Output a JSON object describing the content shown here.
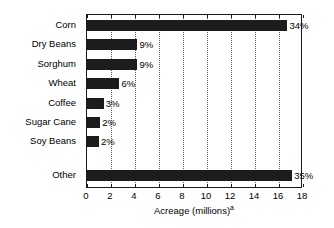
{
  "chart_data": {
    "type": "bar",
    "orientation": "horizontal",
    "title": "",
    "xlabel": "Acreage (millions)",
    "xlabel_superscript": "a",
    "ylabel": "",
    "xlim": [
      0,
      18
    ],
    "xticks": [
      0,
      2,
      4,
      6,
      8,
      10,
      12,
      14,
      16,
      18
    ],
    "xtick_labels": [
      "0",
      "2",
      "4",
      "6",
      "8",
      "10",
      "12",
      "14",
      "16",
      "18"
    ],
    "grid": "vertical-dotted",
    "legend": "none",
    "bar_color": "#1c1c1c",
    "categories": [
      "Corn",
      "Dry Beans",
      "Sorghum",
      "Wheat",
      "Coffee",
      "Sugar Cane",
      "Soy Beans",
      "Other"
    ],
    "values": [
      16.7,
      4.2,
      4.2,
      2.7,
      1.4,
      1.1,
      1.0,
      17.1
    ],
    "data_labels": [
      "34%",
      "9%",
      "9%",
      "6%",
      "3%",
      "2%",
      "2%",
      "35%"
    ],
    "bars": [
      {
        "category": "Corn",
        "value": 16.7,
        "label": "34%"
      },
      {
        "category": "Dry Beans",
        "value": 4.2,
        "label": "9%"
      },
      {
        "category": "Sorghum",
        "value": 4.2,
        "label": "9%"
      },
      {
        "category": "Wheat",
        "value": 2.7,
        "label": "6%"
      },
      {
        "category": "Coffee",
        "value": 1.4,
        "label": "3%"
      },
      {
        "category": "Sugar Cane",
        "value": 1.1,
        "label": "2%"
      },
      {
        "category": "Soy Beans",
        "value": 1.0,
        "label": "2%"
      },
      {
        "category": "Other",
        "value": 17.1,
        "label": "35%"
      }
    ]
  }
}
